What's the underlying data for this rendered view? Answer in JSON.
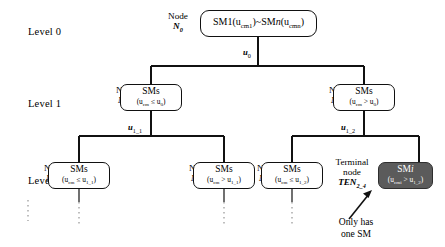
{
  "figure": {
    "type": "tree-diagram",
    "levels": [
      {
        "id": "level-0",
        "label": "Level 0"
      },
      {
        "id": "level-1",
        "label": "Level 1"
      },
      {
        "id": "level-2",
        "label": "Level 2"
      }
    ],
    "colors": {
      "stroke": "#111111",
      "box_fill": "#ffffff",
      "terminal_fill": "#5b5b5b",
      "terminal_text": "#ffffff"
    },
    "nodes": [
      {
        "id": "root",
        "level": 0,
        "caption_line1": "Node",
        "caption_line2_base": "N",
        "caption_line2_sub": "0",
        "box_main": "SM1(u",
        "box_main_sub1": "cm1",
        "box_main_mid": ")~SM",
        "box_main_italic": "n",
        "box_main_tail": "(u",
        "box_main_sub2": "cmn",
        "box_main_end": ")",
        "box_sub": ""
      },
      {
        "id": "n-1-1",
        "level": 1,
        "caption_line1": "Node",
        "caption_line2_base": "N",
        "caption_line2_sub": "1_1",
        "box_main": "SMs",
        "box_sub_open": "(u",
        "box_sub_sub": "cm",
        "box_sub_op": " ≤ u",
        "box_sub_sub2": "0",
        "box_sub_close": ")"
      },
      {
        "id": "n-1-2",
        "level": 1,
        "caption_line1": "Node",
        "caption_line2_base": "N",
        "caption_line2_sub": "1_2",
        "box_main": "SMs",
        "box_sub_open": "(u",
        "box_sub_sub": "cm",
        "box_sub_op": " > u",
        "box_sub_sub2": "0",
        "box_sub_close": ")"
      },
      {
        "id": "n-2-1",
        "level": 2,
        "caption_line1": "Node",
        "caption_line2_base": "N",
        "caption_line2_sub": "2_1",
        "box_main": "SMs",
        "box_sub_open": "(u",
        "box_sub_sub": "cm",
        "box_sub_op": " ≤ u",
        "box_sub_sub2": "1_1",
        "box_sub_close": ")"
      },
      {
        "id": "n-2-2",
        "level": 2,
        "caption_line1": "Node",
        "caption_line2_base": "N",
        "caption_line2_sub": "2_2",
        "box_main": "SMs",
        "box_sub_open": "(u",
        "box_sub_sub": "cm",
        "box_sub_op": " > u",
        "box_sub_sub2": "1_1",
        "box_sub_close": ")"
      },
      {
        "id": "n-2-3",
        "level": 2,
        "caption_line1": "Node",
        "caption_line2_base": "N",
        "caption_line2_sub": "2_3",
        "box_main": "SMs",
        "box_sub_open": "(u",
        "box_sub_sub": "cm",
        "box_sub_op": " ≤ u",
        "box_sub_sub2": "1_2",
        "box_sub_close": ")"
      },
      {
        "id": "ten-2-4",
        "level": 2,
        "terminal": true,
        "caption_line1": "Terminal",
        "caption_line1b": "node",
        "caption_line2_base": "TEN",
        "caption_line2_sub": "2_4",
        "box_main": "SM",
        "box_main_italic": "i",
        "box_sub_open": "(u",
        "box_sub_sub": "cmi",
        "box_sub_op": " > u",
        "box_sub_sub2": "1_2",
        "box_sub_close": ")"
      }
    ],
    "edge_labels": [
      {
        "id": "u0",
        "base": "u",
        "sub": "0"
      },
      {
        "id": "u1_1",
        "base": "u",
        "sub": "1_1"
      },
      {
        "id": "u1_2",
        "base": "u",
        "sub": "1_2"
      }
    ],
    "annotation": {
      "line1": "Only has",
      "line2": "one SM"
    }
  }
}
